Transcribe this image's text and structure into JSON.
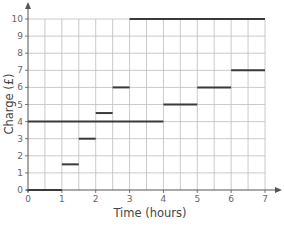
{
  "chart_data": {
    "type": "line",
    "subtype": "step",
    "title": "",
    "xlabel": "Time (hours)",
    "ylabel": "Charge (£)",
    "xlim": [
      0,
      7
    ],
    "ylim": [
      0,
      10
    ],
    "x_ticks": [
      "0",
      "1",
      "2",
      "3",
      "4",
      "5",
      "6",
      "7"
    ],
    "y_ticks": [
      "0",
      "1",
      "2",
      "3",
      "4",
      "5",
      "6",
      "7",
      "8",
      "9",
      "10"
    ],
    "grid": {
      "on": true,
      "x_step": 0.5,
      "y_step": 1
    },
    "legend": null,
    "series": [
      {
        "name": "Car park A",
        "segments": [
          {
            "x0": 0,
            "x1": 1,
            "y": 0
          },
          {
            "x0": 1,
            "x1": 1.5,
            "y": 1.5
          },
          {
            "x0": 1.5,
            "x1": 2,
            "y": 3
          },
          {
            "x0": 2,
            "x1": 2.5,
            "y": 4.5
          },
          {
            "x0": 2.5,
            "x1": 3,
            "y": 6
          },
          {
            "x0": 3,
            "x1": 7,
            "y": 10
          }
        ]
      },
      {
        "name": "Car park B",
        "segments": [
          {
            "x0": 0,
            "x1": 4,
            "y": 4
          },
          {
            "x0": 4,
            "x1": 5,
            "y": 5
          },
          {
            "x0": 5,
            "x1": 6,
            "y": 6
          },
          {
            "x0": 6,
            "x1": 7,
            "y": 7
          }
        ]
      }
    ]
  },
  "colors": {
    "grid": "#bdbdbd",
    "axis": "#555555",
    "segment": "#3a3a3a"
  }
}
